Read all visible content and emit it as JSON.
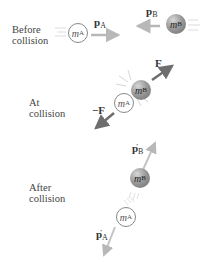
{
  "phases": [
    {
      "id": "before",
      "label_line1": "Before",
      "label_line2": "collision"
    },
    {
      "id": "at",
      "label_line1": "At",
      "label_line2": "collision"
    },
    {
      "id": "after",
      "label_line1": "After",
      "label_line2": "collision"
    }
  ],
  "masses": {
    "a": {
      "symbol": "m",
      "sub": "A"
    },
    "b": {
      "symbol": "m",
      "sub": "B"
    }
  },
  "vectors": {
    "pA": {
      "symbol": "p",
      "sub": "A",
      "prime": ""
    },
    "pB": {
      "symbol": "p",
      "sub": "B",
      "prime": ""
    },
    "F": {
      "symbol": "F",
      "sign": ""
    },
    "negF": {
      "symbol": "F",
      "sign": "−"
    },
    "pA_after": {
      "symbol": "p",
      "sub": "A",
      "prime": "′"
    },
    "pB_after": {
      "symbol": "p",
      "sub": "B",
      "prime": "′"
    }
  },
  "colors": {
    "momentum_arrow": "#b8b8b8",
    "force_arrow": "#6e6e6e",
    "ball_a_fill": "#ffffff",
    "ball_b_fill": "#9a9a9a"
  }
}
